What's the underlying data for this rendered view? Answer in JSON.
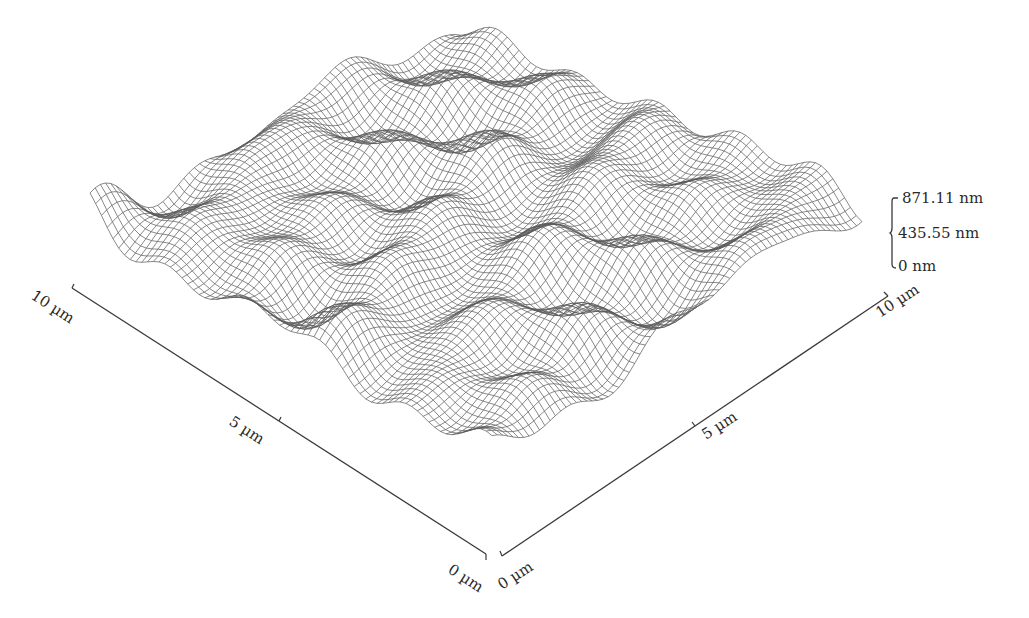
{
  "chart_data": {
    "type": "surface-3d-wireframe",
    "title": "",
    "x_axis": {
      "label": "",
      "unit": "µm",
      "ticks": [
        "10 µm",
        "5 µm",
        "0 µm"
      ],
      "range": [
        0,
        10
      ]
    },
    "y_axis": {
      "label": "",
      "unit": "µm",
      "ticks": [
        "0 µm",
        "5 µm",
        "10 µm"
      ],
      "range": [
        0,
        10
      ]
    },
    "z_axis": {
      "label": "",
      "unit": "nm",
      "ticks": [
        "871.11 nm",
        "435.55 nm",
        "0 nm"
      ],
      "range": [
        0,
        871.11
      ]
    },
    "grid": false,
    "legend": null
  },
  "labels": {
    "x_left_max": "10 µm",
    "x_left_mid": "5 µm",
    "x_left_min": "0 µm",
    "y_right_min": "0 µm",
    "y_right_mid": "5 µm",
    "y_right_max": "10 µm",
    "z_max": "871.11 nm",
    "z_mid": "435.55 nm",
    "z_min": "0 nm"
  },
  "colors": {
    "mesh": "#5a5a5a",
    "axis": "#3a3a3a",
    "background": "#ffffff"
  }
}
